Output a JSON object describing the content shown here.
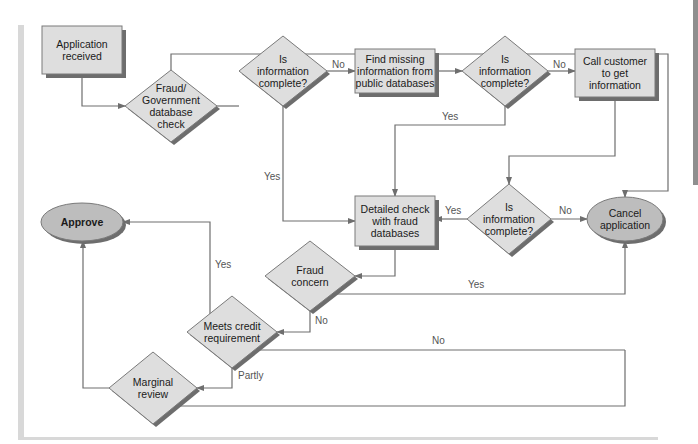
{
  "colors": {
    "box_fill": "#dedede",
    "box_stroke": "#7a7a7a",
    "shadow": "#6d6d6d",
    "oval_fill": "#bdbdbd",
    "edge": "#6e6e6e",
    "rule": "#d8d8d8",
    "side_tab": "#8f8f8f"
  },
  "nodes": [
    {
      "id": "app-received",
      "type": "rect",
      "lines": [
        "Application",
        "received"
      ],
      "x": 42,
      "y": 26,
      "w": 80,
      "h": 48,
      "bold": false
    },
    {
      "id": "fraud-gov-check",
      "type": "diamond",
      "lines": [
        "Fraud/",
        "Government",
        "database",
        "check"
      ],
      "cx": 171,
      "cy": 106,
      "rw": 46,
      "rh": 36,
      "bold": false
    },
    {
      "id": "info-complete-1",
      "type": "diamond",
      "lines": [
        "Is",
        "information",
        "complete?"
      ],
      "cx": 283,
      "cy": 71,
      "rw": 44,
      "rh": 35,
      "bold": false
    },
    {
      "id": "find-missing",
      "type": "rect",
      "lines": [
        "Find missing",
        "information from",
        "public databases"
      ],
      "x": 355,
      "y": 49,
      "w": 80,
      "h": 44,
      "bold": false
    },
    {
      "id": "info-complete-2",
      "type": "diamond",
      "lines": [
        "Is",
        "information",
        "complete?"
      ],
      "cx": 505,
      "cy": 71,
      "rw": 43,
      "rh": 35,
      "bold": false
    },
    {
      "id": "call-customer",
      "type": "rect",
      "lines": [
        "Call customer",
        "to get",
        "information"
      ],
      "x": 575,
      "y": 49,
      "w": 80,
      "h": 48,
      "bold": false
    },
    {
      "id": "info-complete-3",
      "type": "diamond",
      "lines": [
        "Is",
        "information",
        "complete?"
      ],
      "cx": 509,
      "cy": 219,
      "rw": 42,
      "rh": 35,
      "bold": false
    },
    {
      "id": "detailed-check",
      "type": "rect",
      "lines": [
        "Detailed check",
        "with fraud",
        "databases"
      ],
      "x": 355,
      "y": 196,
      "w": 80,
      "h": 50,
      "bold": false
    },
    {
      "id": "cancel-application",
      "type": "oval",
      "lines": [
        "Cancel",
        "application"
      ],
      "cx": 625,
      "cy": 219,
      "rx": 38,
      "ry": 22,
      "bold": false
    },
    {
      "id": "approve",
      "type": "oval",
      "lines": [
        "Approve"
      ],
      "cx": 82,
      "cy": 222,
      "rx": 41,
      "ry": 19,
      "bold": true
    },
    {
      "id": "fraud-concern",
      "type": "diamond",
      "lines": [
        "Fraud",
        "concern"
      ],
      "cx": 310,
      "cy": 276,
      "rw": 45,
      "rh": 35,
      "bold": false
    },
    {
      "id": "meets-credit",
      "type": "diamond",
      "lines": [
        "Meets credit",
        "requirement"
      ],
      "cx": 232,
      "cy": 332,
      "rw": 45,
      "rh": 36,
      "bold": false
    },
    {
      "id": "marginal-review",
      "type": "diamond",
      "lines": [
        "Marginal",
        "review"
      ],
      "cx": 153,
      "cy": 388,
      "rw": 44,
      "rh": 36,
      "bold": false
    }
  ],
  "edges": [
    {
      "id": "app-to-fraudgov",
      "points": [
        [
          82,
          74
        ],
        [
          82,
          106
        ],
        [
          125,
          106
        ]
      ],
      "arrow": true,
      "label": ""
    },
    {
      "id": "fraudgov-to-info1",
      "points": [
        [
          217,
          106
        ],
        [
          239,
          106
        ]
      ],
      "arrow": false,
      "label": ""
    },
    {
      "id": "fraudgov-to-cancel-top",
      "points": [
        [
          171,
          70
        ],
        [
          171,
          54
        ],
        [
          668,
          54
        ],
        [
          668,
          191
        ],
        [
          625,
          191
        ],
        [
          625,
          197
        ]
      ],
      "arrow": true,
      "label": ""
    },
    {
      "id": "info1-to-find-no",
      "points": [
        [
          327,
          71
        ],
        [
          355,
          71
        ]
      ],
      "arrow": true,
      "label": "No",
      "lx": 332,
      "ly": 68
    },
    {
      "id": "find-to-info2",
      "points": [
        [
          435,
          71
        ],
        [
          462,
          71
        ]
      ],
      "arrow": true,
      "label": ""
    },
    {
      "id": "info2-to-call-no",
      "points": [
        [
          548,
          71
        ],
        [
          575,
          71
        ]
      ],
      "arrow": true,
      "label": "No",
      "lx": 553,
      "ly": 68
    },
    {
      "id": "info1-to-detailed-yes",
      "points": [
        [
          283,
          106
        ],
        [
          283,
          221
        ],
        [
          355,
          221
        ]
      ],
      "arrow": true,
      "label": "Yes",
      "lx": 264,
      "ly": 180
    },
    {
      "id": "info2-to-detailed-yes",
      "points": [
        [
          505,
          106
        ],
        [
          505,
          125
        ],
        [
          395,
          125
        ],
        [
          395,
          196
        ]
      ],
      "arrow": true,
      "label": "Yes",
      "lx": 442,
      "ly": 120
    },
    {
      "id": "call-to-info3",
      "points": [
        [
          615,
          97
        ],
        [
          615,
          156
        ],
        [
          509,
          156
        ],
        [
          509,
          184
        ]
      ],
      "arrow": true,
      "label": ""
    },
    {
      "id": "info3-to-detailed-yes",
      "points": [
        [
          467,
          219
        ],
        [
          435,
          219
        ]
      ],
      "arrow": true,
      "label": "Yes",
      "lx": 445,
      "ly": 214
    },
    {
      "id": "info3-to-cancel-no",
      "points": [
        [
          551,
          219
        ],
        [
          587,
          219
        ]
      ],
      "arrow": true,
      "label": "No",
      "lx": 559,
      "ly": 214
    },
    {
      "id": "detailed-to-fraudconcern",
      "points": [
        [
          395,
          246
        ],
        [
          395,
          276
        ],
        [
          355,
          276
        ]
      ],
      "arrow": true,
      "label": ""
    },
    {
      "id": "fraudconcern-to-cancel-yes",
      "points": [
        [
          333,
          294
        ],
        [
          625,
          294
        ],
        [
          625,
          241
        ]
      ],
      "arrow": true,
      "label": "Yes",
      "lx": 468,
      "ly": 288
    },
    {
      "id": "fraudconcern-to-meets-no",
      "points": [
        [
          310,
          311
        ],
        [
          310,
          332
        ],
        [
          277,
          332
        ]
      ],
      "arrow": true,
      "label": "No",
      "lx": 315,
      "ly": 324
    },
    {
      "id": "meets-to-approve-yes",
      "points": [
        [
          210,
          314
        ],
        [
          210,
          222
        ],
        [
          123,
          222
        ]
      ],
      "arrow": true,
      "label": "Yes",
      "lx": 215,
      "ly": 268
    },
    {
      "id": "meets-to-cancel-no",
      "points": [
        [
          259,
          350
        ],
        [
          625,
          350
        ]
      ],
      "arrow": false,
      "label": "No",
      "lx": 432,
      "ly": 344
    },
    {
      "id": "meets-to-marginal-partly",
      "points": [
        [
          232,
          368
        ],
        [
          232,
          388
        ],
        [
          197,
          388
        ]
      ],
      "arrow": true,
      "label": "Partly",
      "lx": 238,
      "ly": 379
    },
    {
      "id": "marginal-to-approve",
      "points": [
        [
          109,
          388
        ],
        [
          83,
          388
        ],
        [
          83,
          241
        ]
      ],
      "arrow": true,
      "label": ""
    },
    {
      "id": "marginal-to-cancel",
      "points": [
        [
          180,
          406
        ],
        [
          625,
          406
        ],
        [
          625,
          350
        ]
      ],
      "arrow": false,
      "label": ""
    }
  ]
}
